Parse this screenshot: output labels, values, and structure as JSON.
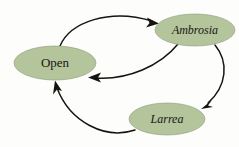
{
  "diagram": {
    "background_color": "#fdfdfb",
    "node_fill_color": "#b4c49b",
    "node_stroke_color": "#8a9b7c",
    "edge_color": "#15140f",
    "label_color": "#171714",
    "nodes": [
      {
        "id": "open",
        "label": "Open",
        "style": "roman",
        "cx": 55,
        "cy": 63,
        "rx": 41,
        "ry": 17,
        "font_size": 13
      },
      {
        "id": "ambrosia",
        "label": "Ambrosia",
        "style": "italic",
        "cx": 195,
        "cy": 30,
        "rx": 40,
        "ry": 16,
        "font_size": 12
      },
      {
        "id": "larrea",
        "label": "Larrea",
        "style": "italic",
        "cx": 167,
        "cy": 119,
        "rx": 38,
        "ry": 16,
        "font_size": 12
      }
    ],
    "edges": [
      {
        "id": "open-to-ambrosia",
        "from": "open",
        "to": "ambrosia",
        "label": "",
        "direction": "clockwise-top"
      },
      {
        "id": "ambrosia-to-open",
        "from": "ambrosia",
        "to": "open",
        "label": "",
        "direction": "lower-return"
      },
      {
        "id": "ambrosia-to-larrea",
        "from": "ambrosia",
        "to": "larrea",
        "label": "",
        "direction": "right-descending"
      },
      {
        "id": "larrea-to-open",
        "from": "larrea",
        "to": "open",
        "label": "",
        "direction": "bottom-ascending"
      }
    ]
  }
}
